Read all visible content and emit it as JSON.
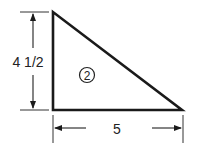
{
  "figure": {
    "shape": "right triangle",
    "region_label": "2",
    "height_label": "4 1/2",
    "base_label": "5",
    "colors": {
      "stroke": "#1a1a1a",
      "background": "#ffffff"
    }
  }
}
